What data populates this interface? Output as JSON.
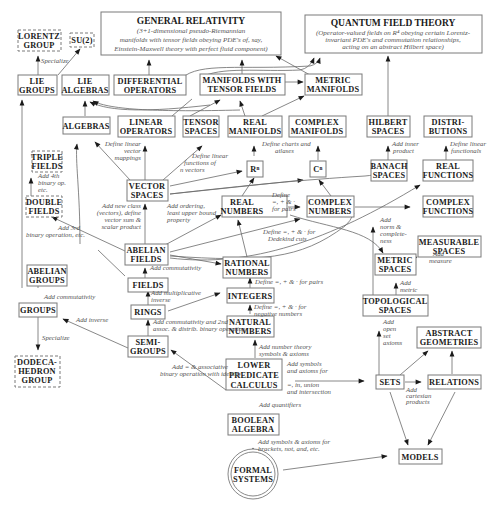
{
  "diagram": {
    "nodes": {
      "general_relativity": {
        "title": "GENERAL RELATIVITY",
        "lines": [
          "(3+1-dimensional pseudo-Riemannian",
          "manifolds with tensor fields obeying PDE's of, say,",
          "Einstein-Maxwell theory with perfect fluid component)"
        ]
      },
      "quantum_field_theory": {
        "title": "QUANTUM FIELD THEORY",
        "lines": [
          "(Operator-valued fields on R⁴ obeying certain Lorentz-",
          "invariant PDE's and commutation relationships,",
          "acting on an abstract Hilbert space)"
        ]
      },
      "lorentz_group": {
        "lines": [
          "LORENTZ",
          "GROUP"
        ]
      },
      "su2": {
        "lines": [
          "SU(2)"
        ]
      },
      "lie_groups": {
        "lines": [
          "LIE",
          "GROUPS"
        ]
      },
      "lie_algebras": {
        "lines": [
          "LIE",
          "ALGEBRAS"
        ]
      },
      "differential_operators": {
        "lines": [
          "DIFFERENTIAL",
          "OPERATORS"
        ]
      },
      "manifolds_tensor": {
        "lines": [
          "MANIFOLDS WITH",
          "TENSOR FIELDS"
        ]
      },
      "metric_manifolds": {
        "lines": [
          "METRIC",
          "MANIFOLDS"
        ]
      },
      "algebras": {
        "lines": [
          "ALGEBRAS"
        ]
      },
      "linear_operators": {
        "lines": [
          "LINEAR",
          "OPERATORS"
        ]
      },
      "tensor_spaces": {
        "lines": [
          "TENSOR",
          "SPACES"
        ]
      },
      "real_manifolds": {
        "lines": [
          "REAL",
          "MANIFOLDS"
        ]
      },
      "complex_manifolds": {
        "lines": [
          "COMPLEX",
          "MANIFOLDS"
        ]
      },
      "hilbert_spaces": {
        "lines": [
          "HILBERT",
          "SPACES"
        ]
      },
      "distributions": {
        "lines": [
          "DISTRI-",
          "BUTIONS"
        ]
      },
      "rn": {
        "lines": [
          "Rⁿ"
        ]
      },
      "cn": {
        "lines": [
          "Cⁿ"
        ]
      },
      "banach_spaces": {
        "lines": [
          "BANACH",
          "SPACES"
        ]
      },
      "real_functions": {
        "lines": [
          "REAL",
          "FUNCTIONS"
        ]
      },
      "triple_fields": {
        "lines": [
          "TRIPLE",
          "FIELDS"
        ]
      },
      "double_fields": {
        "lines": [
          "DOUBLE",
          "FIELDS"
        ]
      },
      "vector_spaces": {
        "lines": [
          "VECTOR",
          "SPACES"
        ]
      },
      "real_numbers": {
        "lines": [
          "REAL",
          "NUMBERS"
        ]
      },
      "complex_numbers": {
        "lines": [
          "COMPLEX",
          "NUMBERS"
        ]
      },
      "complex_functions": {
        "lines": [
          "COMPLEX",
          "FUNCTIONS"
        ]
      },
      "abelian_fields": {
        "lines": [
          "ABELIAN",
          "FIELDS"
        ]
      },
      "rational_numbers": {
        "lines": [
          "RATIONAL",
          "NUMBERS"
        ]
      },
      "measurable_spaces": {
        "lines": [
          "MEASURABLE",
          "SPACES"
        ]
      },
      "metric_spaces": {
        "lines": [
          "METRIC",
          "SPACES"
        ]
      },
      "abelian_groups": {
        "lines": [
          "ABELIAN",
          "GROUPS"
        ]
      },
      "fields": {
        "lines": [
          "FIELDS"
        ]
      },
      "integers": {
        "lines": [
          "INTEGERS"
        ]
      },
      "groups": {
        "lines": [
          "GROUPS"
        ]
      },
      "rings": {
        "lines": [
          "RINGS"
        ]
      },
      "natural_numbers": {
        "lines": [
          "NATURAL",
          "NUMBERS"
        ]
      },
      "topological_spaces": {
        "lines": [
          "TOPOLOGICAL",
          "SPACES"
        ]
      },
      "semi_groups": {
        "lines": [
          "SEMI-",
          "GROUPS"
        ]
      },
      "abstract_geometries": {
        "lines": [
          "ABSTRACT",
          "GEOMETRIES"
        ]
      },
      "dodecahedron_group": {
        "lines": [
          "DODECA-",
          "HEDRON",
          "GROUP"
        ]
      },
      "lower_predicate_calculus": {
        "lines": [
          "LOWER",
          "PREDICATE",
          "CALCULUS"
        ]
      },
      "sets": {
        "lines": [
          "SETS"
        ]
      },
      "relations": {
        "lines": [
          "RELATIONS"
        ]
      },
      "boolean_algebra": {
        "lines": [
          "BOOLEAN",
          "ALGEBRA"
        ]
      },
      "models": {
        "lines": [
          "MODELS"
        ]
      },
      "formal_systems": {
        "lines": [
          "FORMAL",
          "SYSTEMS"
        ]
      }
    },
    "edge_labels": {
      "specialize_lorentz": [
        "Specialize"
      ],
      "define_linear_mappings": [
        "Define linear",
        "vector",
        "mappings"
      ],
      "define_linear_functions": [
        "Define linear",
        "functions of",
        "n vectors"
      ],
      "define_charts": [
        "Define charts and",
        "atlases"
      ],
      "add_inner_product": [
        "Add inner",
        "product"
      ],
      "define_linear_functionals": [
        "Define linear",
        "functionals"
      ],
      "add_4th": [
        "Add 4th",
        "binary op.",
        "etc."
      ],
      "add_new_class": [
        "Add new class",
        "(vectors), define",
        "vector sum &",
        "scalar product"
      ],
      "add_ordering": [
        "Add ordering,",
        "least upper bound",
        "property"
      ],
      "define_pairs_complex": [
        "Define",
        "=, + & ·",
        "for pairs"
      ],
      "add_3rd": [
        "Add 3rd",
        "binary operation, etc."
      ],
      "define_dedekind": [
        "Define =, + & · for",
        "Dedekind cuts"
      ],
      "add_norm": [
        "Add",
        "norm &",
        "complete-",
        "ness"
      ],
      "add_measure": [
        "Add",
        "measure"
      ],
      "add_commutativity_fields": [
        "Add commutativity"
      ],
      "define_pairs_rational": [
        "Define =, + & · for pairs"
      ],
      "add_metric": [
        "Add",
        "metric"
      ],
      "add_commutativity_groups": [
        "Add commutativity"
      ],
      "add_mult_inverse": [
        "Add multiplicative",
        "inverse"
      ],
      "define_negative": [
        "Define =, + & · for",
        "negative numbers"
      ],
      "add_inverse": [
        "Add inverse"
      ],
      "add_comm_2nd": [
        "Add commutativity and 2nd",
        "assoc. & distrib. binary operation"
      ],
      "add_open_set": [
        "Add",
        "open",
        "set",
        "axioms"
      ],
      "specialize_dodeca": [
        "Specialize"
      ],
      "add_number_theory": [
        "Add number theory",
        "symbols & axioms"
      ],
      "add_assoc": [
        "Add = & associative",
        "binary operation with identity"
      ],
      "add_symbols_sets": [
        "Add symbols",
        "and axioms for",
        "=, in, union",
        "and intersection"
      ],
      "add_cartesian": [
        "Add",
        "cartesian",
        "products"
      ],
      "add_quantifiers": [
        "Add quantifiers"
      ],
      "add_symbols_brackets": [
        "Add symbols & axioms for",
        "brackets, not, and, etc."
      ]
    }
  }
}
